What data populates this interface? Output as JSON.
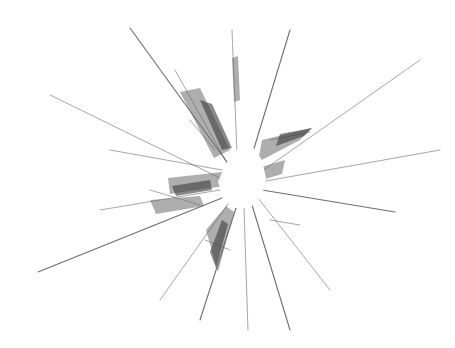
{
  "image": {
    "subject": "shattered glass with radial cracks",
    "background_color": "#ffffff",
    "crack_color": "#555555",
    "impact_center": [
      240,
      180
    ],
    "width": 455,
    "height": 348
  }
}
